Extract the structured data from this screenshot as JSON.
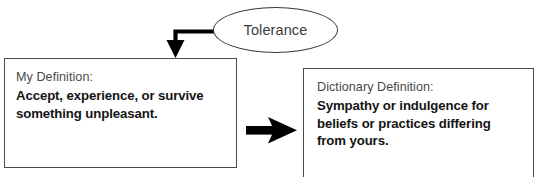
{
  "diagram": {
    "title_node": {
      "label": "Tolerance",
      "shape": "ellipse",
      "stroke_color": "#3a3a3a"
    },
    "boxes": [
      {
        "id": "my-definition",
        "heading": "My Definition:",
        "body_lines": [
          "Accept, experience, or survive",
          "something unpleasant."
        ],
        "border_color": "#4a4a4a"
      },
      {
        "id": "dictionary-definition",
        "heading": "Dictionary Definition:",
        "body_lines": [
          "Sympathy or indulgence for",
          "beliefs or practices differing",
          "from yours."
        ],
        "border_color": "#4a4a4a"
      }
    ],
    "connectors": [
      {
        "id": "elbow-connector",
        "from": "title-node",
        "to": "my-definition-box",
        "style": "elbow-down-arrow",
        "color": "#000000"
      },
      {
        "id": "straight-connector",
        "from": "my-definition-box",
        "to": "dictionary-definition-box",
        "style": "right-arrow",
        "color": "#000000"
      }
    ]
  }
}
